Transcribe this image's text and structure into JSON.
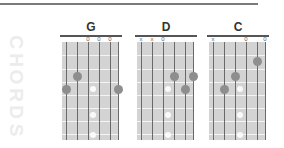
{
  "side_title": "CHORDS",
  "colors": {
    "board": "#d3d3d3",
    "finger_dot": "#8e8e8e",
    "inlay": "#fafafa",
    "string": "#6a6a6a",
    "title_watermark": "#ececec"
  },
  "chords": [
    {
      "name": "G",
      "markers": [
        "",
        "",
        "0",
        "0",
        "0",
        ""
      ],
      "fingers": [
        {
          "string": 1,
          "fret": 3
        },
        {
          "string": 2,
          "fret": 2
        },
        {
          "string": 6,
          "fret": 3
        }
      ]
    },
    {
      "name": "D",
      "markers": [
        "x",
        "x",
        "0",
        "",
        "",
        ""
      ],
      "fingers": [
        {
          "string": 4,
          "fret": 2
        },
        {
          "string": 5,
          "fret": 3
        },
        {
          "string": 6,
          "fret": 2
        }
      ]
    },
    {
      "name": "C",
      "markers": [
        "x",
        "",
        "",
        "0",
        "",
        "0"
      ],
      "fingers": [
        {
          "string": 2,
          "fret": 3
        },
        {
          "string": 3,
          "fret": 2
        },
        {
          "string": 5,
          "fret": 1
        }
      ]
    }
  ],
  "inlay_frets": [
    3,
    5,
    7
  ]
}
